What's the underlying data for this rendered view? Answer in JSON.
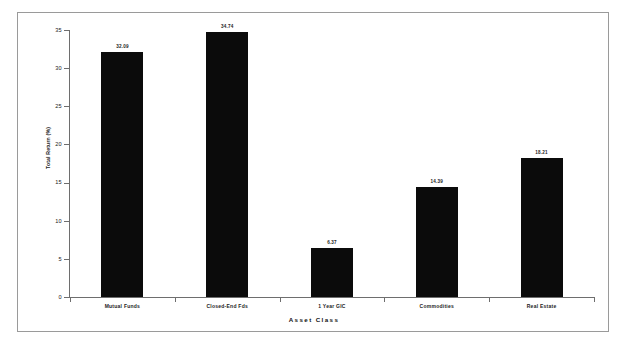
{
  "chart_data": {
    "type": "bar",
    "title": "",
    "xlabel": "Asset Class",
    "ylabel": "Total Return (%)",
    "categories": [
      "Mutual Funds",
      "Closed-End Fds",
      "1 Year GIC",
      "Commodities",
      "Real Estate"
    ],
    "values": [
      32.09,
      34.74,
      6.37,
      14.39,
      18.21
    ],
    "value_labels": [
      "32.09",
      "34.74",
      "6.37",
      "14.39",
      "18.21"
    ],
    "ylim": [
      0,
      35
    ],
    "yticks": [
      0,
      5,
      10,
      15,
      20,
      25,
      30,
      35
    ],
    "ytick_labels": [
      "0",
      "5",
      "10",
      "15",
      "20",
      "25",
      "30",
      "35"
    ],
    "grid": false,
    "legend": "none",
    "bar_color": "#0b0b0b",
    "axis_color": "#6e6e6e",
    "frame_color": "#9a9a9a",
    "background": "#ffffff"
  }
}
